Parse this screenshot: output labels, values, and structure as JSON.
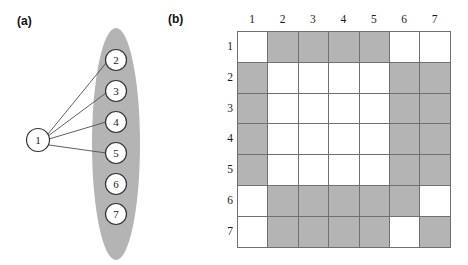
{
  "figure": {
    "panels": [
      {
        "key": "a",
        "label": "(a)"
      },
      {
        "key": "b",
        "label": "(b)"
      }
    ]
  },
  "graph": {
    "cluster_shape": "ellipse",
    "colors": {
      "cluster_fill": "#b4b4b4",
      "node_fill": "#ffffff",
      "node_stroke": "#333333",
      "edge_stroke": "#4d4d4d"
    },
    "nodes": [
      {
        "id": "1",
        "label": "1",
        "cx": 38,
        "cy": 140,
        "r": 11.5,
        "in_cluster": false
      },
      {
        "id": "2",
        "label": "2",
        "cx": 116,
        "cy": 60,
        "r": 10.5,
        "in_cluster": true
      },
      {
        "id": "3",
        "label": "3",
        "cx": 116,
        "cy": 91,
        "r": 10.5,
        "in_cluster": true
      },
      {
        "id": "4",
        "label": "4",
        "cx": 116,
        "cy": 122,
        "r": 10.5,
        "in_cluster": true
      },
      {
        "id": "5",
        "label": "5",
        "cx": 116,
        "cy": 153,
        "r": 10.5,
        "in_cluster": true
      },
      {
        "id": "6",
        "label": "6",
        "cx": 116,
        "cy": 184,
        "r": 10.5,
        "in_cluster": true
      },
      {
        "id": "7",
        "label": "7",
        "cx": 116,
        "cy": 214,
        "r": 10.5,
        "in_cluster": true
      }
    ],
    "edges": [
      {
        "from": "1",
        "to": "2"
      },
      {
        "from": "1",
        "to": "3"
      },
      {
        "from": "1",
        "to": "4"
      },
      {
        "from": "1",
        "to": "5"
      }
    ]
  },
  "chart_data": {
    "type": "heatmap",
    "title": "",
    "xlabel": "",
    "ylabel": "",
    "legend": [],
    "grid": true,
    "column_headers": [
      "1",
      "2",
      "3",
      "4",
      "5",
      "6",
      "7"
    ],
    "row_headers": [
      "1",
      "2",
      "3",
      "4",
      "5",
      "6",
      "7"
    ],
    "value_colors": {
      "0": "#ffffff",
      "1": "#b4b4b4"
    },
    "values": [
      [
        0,
        1,
        1,
        1,
        1,
        0,
        0
      ],
      [
        1,
        0,
        0,
        0,
        0,
        1,
        1
      ],
      [
        1,
        0,
        0,
        0,
        0,
        1,
        1
      ],
      [
        1,
        0,
        0,
        0,
        0,
        1,
        1
      ],
      [
        1,
        0,
        0,
        0,
        0,
        1,
        1
      ],
      [
        0,
        1,
        1,
        1,
        1,
        1,
        0
      ],
      [
        0,
        1,
        1,
        1,
        1,
        0,
        1
      ]
    ]
  }
}
